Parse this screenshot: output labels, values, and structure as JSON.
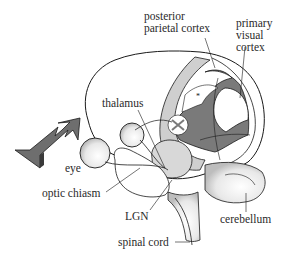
{
  "diagram": {
    "labels": {
      "posterior_parietal_cortex": "posterior\nparietal cortex",
      "primary_visual_cortex": "primary\nvisual\ncortex",
      "thalamus": "thalamus",
      "eye": "eye",
      "optic_chiasm": "optic chiasm",
      "lgn": "LGN",
      "cerebellum": "cerebellum",
      "spinal_cord": "spinal cord"
    },
    "marker": "*",
    "colors": {
      "outline": "#1a1a1a",
      "light_band": "#cfcfcf",
      "dark_region": "#7a7a7a",
      "arrow": "#6e6e6e",
      "text": "#2a2a2a"
    }
  }
}
